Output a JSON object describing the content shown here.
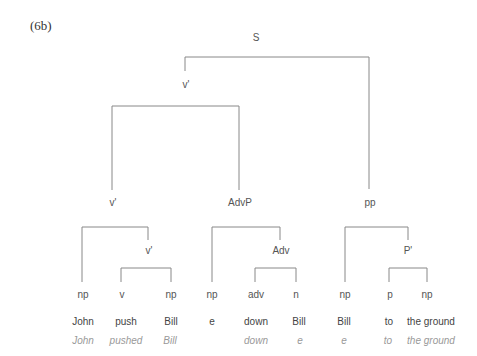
{
  "example_label": "(6b)",
  "nodes": {
    "s": "S",
    "v_bar_top": "v'",
    "v_bar_mid": "v'",
    "advp": "AdvP",
    "pp": "pp",
    "v_bar_low": "v'",
    "adv": "Adv",
    "p_bar": "P'"
  },
  "leaves": [
    {
      "cat": "np",
      "word": "John",
      "gloss": "John"
    },
    {
      "cat": "v",
      "word": "push",
      "gloss": "pushed"
    },
    {
      "cat": "np",
      "word": "Bill",
      "gloss": "Bill"
    },
    {
      "cat": "np",
      "word": "e",
      "gloss": ""
    },
    {
      "cat": "adv",
      "word": "down",
      "gloss": "down"
    },
    {
      "cat": "n",
      "word": "Bill",
      "gloss": "e"
    },
    {
      "cat": "np",
      "word": "Bill",
      "gloss": "e"
    },
    {
      "cat": "p",
      "word": "to",
      "gloss": "to"
    },
    {
      "cat": "np",
      "word": "the ground",
      "gloss": "the ground"
    }
  ],
  "colors": {
    "line": "#888888",
    "label": "#555555",
    "gloss": "#999999"
  }
}
